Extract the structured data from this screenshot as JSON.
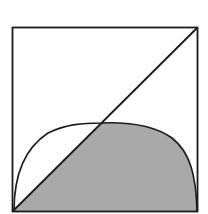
{
  "diagram": {
    "type": "geometry-figure",
    "square": {
      "x": 12,
      "y": 27,
      "size": 186
    },
    "colors": {
      "stroke": "#1a1a1a",
      "fill_shaded": "#a9a9a9",
      "background": "#ffffff"
    }
  }
}
